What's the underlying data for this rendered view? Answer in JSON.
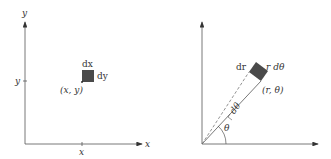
{
  "left_diagram": {
    "title": "Cartesian area element",
    "y_axis_label": "y",
    "x_axis_label": "x",
    "y_tick_label": "y",
    "x_tick_label": "x",
    "point_label": "(x, y)",
    "width_label": "dx",
    "height_label": "dy"
  },
  "right_diagram": {
    "title": "Polar area element",
    "radial_label": "dr",
    "arc_label": "r dθ",
    "point_label": "(r, θ)",
    "angle_label": "θ",
    "delta_angle_label": "dθ"
  },
  "colors": {
    "axis": "#555555",
    "element_fill": "#4a4a4a",
    "text": "#333333"
  }
}
